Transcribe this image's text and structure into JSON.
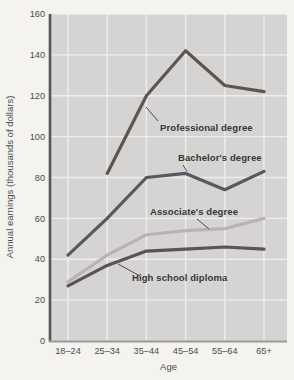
{
  "chart_data": {
    "type": "line",
    "title": "",
    "xlabel": "Age",
    "ylabel": "Annual earnings (thousands of dollars)",
    "categories": [
      "18–24",
      "25–34",
      "35–44",
      "45–54",
      "55–64",
      "65+"
    ],
    "ylim": [
      0,
      160
    ],
    "yticks": [
      0,
      20,
      40,
      60,
      80,
      100,
      120,
      140,
      160
    ],
    "grid": true,
    "legend_position": "inline-annotations",
    "colors": {
      "plot_background": "#d5d4d2",
      "gridline": "#eceeee",
      "y_axis_line": "#565656",
      "x_axis_line": "#9a9a9a",
      "tick_label": "#4b4b4b",
      "annotation_text": "#35383a",
      "leader_line": "#4a4a4a"
    },
    "series": [
      {
        "name": "Professional degree",
        "color": "#5f5452",
        "values": [
          null,
          82,
          120,
          142,
          125,
          122
        ]
      },
      {
        "name": "Bachelor's degree",
        "color": "#555960",
        "values": [
          42,
          60,
          80,
          82,
          74,
          83
        ]
      },
      {
        "name": "Associate's degree",
        "color": "#bdb2b3",
        "values": [
          29,
          42,
          52,
          54,
          55,
          60
        ]
      },
      {
        "name": "High school diploma",
        "color": "#5c5254",
        "values": [
          27,
          37,
          44,
          45,
          46,
          45
        ]
      }
    ]
  }
}
